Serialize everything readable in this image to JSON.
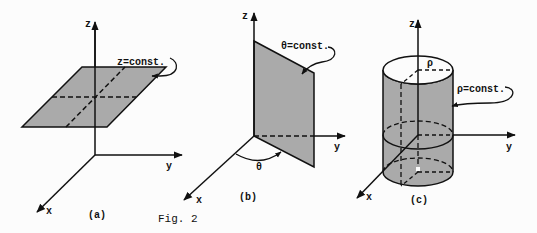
{
  "figure": {
    "caption": "Fig. 2",
    "colors": {
      "ink": "#111111",
      "fill": "#a8a8a8",
      "background": "#fcfcfc"
    },
    "panels": [
      {
        "id": "a",
        "label": "(a)",
        "surface_label": "z=const.",
        "axes": {
          "z": "z",
          "y": "y",
          "x": "x"
        },
        "shape": "horizontal plane"
      },
      {
        "id": "b",
        "label": "(b)",
        "surface_label": "θ=const.",
        "angle_label": "θ",
        "axes": {
          "z": "z",
          "y": "y",
          "x": "x"
        },
        "shape": "vertical half-plane"
      },
      {
        "id": "c",
        "label": "(c)",
        "surface_label": "ρ=const.",
        "radius_label": "ρ",
        "axes": {
          "z": "z",
          "y": "y",
          "x": "x"
        },
        "shape": "cylinder"
      }
    ]
  }
}
